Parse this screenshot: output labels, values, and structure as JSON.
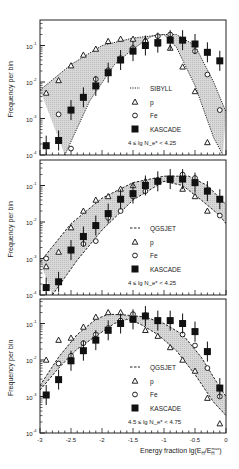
{
  "figure": {
    "ylabel": "Frequency per bin",
    "xlabel": "Energy fraction lg(E",
    "xlabel_sub": "H",
    "xlabel_mid": "/E",
    "xlabel_sub2": "H",
    "xlabel_sup2": "max",
    "xlabel_end": ")",
    "xticks": [
      "-3",
      "-2.5",
      "-2",
      "-1.5",
      "-1",
      "-0.5",
      "0"
    ],
    "yticks": [
      "10",
      "10",
      "10",
      "10"
    ],
    "yexp": [
      "-1",
      "-2",
      "-3",
      "-4"
    ]
  },
  "chart_data": [
    {
      "type": "scatter",
      "title": "",
      "xlabel": "Energy fraction lg(E_H/E_H^max)",
      "ylabel": "Frequency per bin",
      "xlim": [
        -3,
        0
      ],
      "ylim": [
        0.0001,
        0.5
      ],
      "yscale": "log",
      "model": "SIBYLL",
      "model_linestyle": "dotted",
      "condition": "4 ≤ lg N_e* < 4.25",
      "x": [
        -2.9,
        -2.7,
        -2.5,
        -2.3,
        -2.1,
        -1.9,
        -1.7,
        -1.5,
        -1.3,
        -1.1,
        -0.9,
        -0.7,
        -0.5,
        -0.3,
        -0.1
      ],
      "series": [
        {
          "name": "p",
          "marker": "triangle-open",
          "values": [
            0.005,
            0.011,
            0.028,
            0.055,
            0.08,
            0.13,
            0.15,
            0.15,
            0.14,
            0.11,
            0.085,
            0.026,
            0.0055,
            0.00022,
            null
          ]
        },
        {
          "name": "Fe",
          "marker": "circle-open",
          "values": [
            null,
            0.0013,
            0.00015,
            null,
            0.012,
            0.021,
            0.045,
            0.085,
            0.13,
            0.18,
            0.2,
            0.14,
            0.07,
            0.016,
            0.0017
          ]
        },
        {
          "name": "KASCADE",
          "marker": "square-filled",
          "values": [
            0.00018,
            0.00025,
            0.0017,
            0.0038,
            0.0078,
            0.018,
            0.04,
            0.07,
            0.1,
            0.12,
            0.14,
            0.14,
            0.11,
            0.065,
            0.038
          ]
        }
      ],
      "band_upper": [
        [
          -3,
          0.006
        ],
        [
          -2.5,
          0.03
        ],
        [
          -2,
          0.1
        ],
        [
          -1.5,
          0.16
        ],
        [
          -1.0,
          0.2
        ],
        [
          -0.8,
          0.2
        ],
        [
          -0.5,
          0.1
        ],
        [
          -0.2,
          0.01
        ],
        [
          0,
          0.0015
        ]
      ],
      "band_lower": [
        [
          -2.6,
          0.0001
        ],
        [
          -2.2,
          0.003
        ],
        [
          -1.8,
          0.03
        ],
        [
          -1.5,
          0.08
        ],
        [
          -1.2,
          0.18
        ],
        [
          -1.0,
          0.2
        ],
        [
          -0.8,
          0.09
        ],
        [
          -0.5,
          0.008
        ],
        [
          -0.2,
          0.0003
        ],
        [
          -0.05,
          0.0001
        ]
      ]
    },
    {
      "type": "scatter",
      "title": "",
      "xlabel": "Energy fraction lg(E_H/E_H^max)",
      "ylabel": "Frequency per bin",
      "xlim": [
        -3,
        0
      ],
      "ylim": [
        0.0001,
        0.5
      ],
      "yscale": "log",
      "model": "QGSJET",
      "model_linestyle": "dashed",
      "condition": "4 ≤ lg N_e* < 4.25",
      "x": [
        -2.9,
        -2.7,
        -2.5,
        -2.3,
        -2.1,
        -1.9,
        -1.7,
        -1.5,
        -1.3,
        -1.1,
        -0.9,
        -0.7,
        -0.5,
        -0.3,
        -0.1
      ],
      "series": [
        {
          "name": "p",
          "marker": "triangle-open",
          "values": [
            0.0006,
            0.0015,
            0.007,
            0.02,
            0.04,
            0.05,
            0.08,
            0.1,
            0.13,
            0.14,
            0.14,
            0.08,
            0.05,
            0.02,
            null
          ]
        },
        {
          "name": "Fe",
          "marker": "circle-open",
          "values": [
            0.001,
            null,
            null,
            0.0025,
            0.003,
            0.013,
            0.02,
            0.05,
            0.07,
            0.13,
            0.15,
            0.2,
            0.16,
            0.075,
            0.015
          ]
        },
        {
          "name": "KASCADE",
          "marker": "square-filled",
          "values": [
            0.00016,
            0.00023,
            0.0017,
            0.004,
            0.008,
            0.017,
            0.042,
            0.06,
            0.1,
            0.13,
            0.15,
            0.15,
            0.12,
            0.07,
            0.042
          ]
        }
      ],
      "band_upper": [
        [
          -3,
          0.0008
        ],
        [
          -2.5,
          0.009
        ],
        [
          -2,
          0.045
        ],
        [
          -1.5,
          0.12
        ],
        [
          -1.0,
          0.18
        ],
        [
          -0.6,
          0.18
        ],
        [
          -0.3,
          0.1
        ],
        [
          0,
          0.03
        ]
      ],
      "band_lower": [
        [
          -2.8,
          0.0001
        ],
        [
          -2.4,
          0.0009
        ],
        [
          -2,
          0.006
        ],
        [
          -1.5,
          0.04
        ],
        [
          -1.0,
          0.13
        ],
        [
          -0.7,
          0.1
        ],
        [
          -0.4,
          0.04
        ],
        [
          -0.1,
          0.015
        ],
        [
          0,
          0.009
        ]
      ]
    },
    {
      "type": "scatter",
      "title": "",
      "xlabel": "Energy fraction lg(E_H/E_H^max)",
      "ylabel": "Frequency per bin",
      "xlim": [
        -3,
        0
      ],
      "ylim": [
        0.0001,
        0.5
      ],
      "yscale": "log",
      "model": "QGSJET",
      "model_linestyle": "dashed",
      "condition": "4.5 ≤ lg N_e* < 4.75",
      "x": [
        -2.9,
        -2.7,
        -2.5,
        -2.3,
        -2.1,
        -1.9,
        -1.7,
        -1.5,
        -1.3,
        -1.1,
        -0.9,
        -0.7,
        -0.5,
        -0.3,
        -0.1
      ],
      "series": [
        {
          "name": "p",
          "marker": "triangle-open",
          "values": [
            0.01,
            0.035,
            0.04,
            0.08,
            0.15,
            0.2,
            0.2,
            0.15,
            0.065,
            0.045,
            0.022,
            0.01,
            0.005,
            0.0009,
            0.00018
          ]
        },
        {
          "name": "Fe",
          "marker": "circle-open",
          "values": [
            null,
            0.008,
            0.013,
            0.029,
            0.05,
            0.075,
            0.12,
            0.18,
            0.17,
            0.12,
            0.12,
            0.05,
            0.025,
            0.006,
            0.001
          ]
        },
        {
          "name": "KASCADE",
          "marker": "square-filled",
          "values": [
            0.0011,
            0.0029,
            0.0095,
            0.018,
            0.035,
            0.065,
            0.1,
            0.13,
            0.16,
            0.12,
            0.12,
            0.1,
            0.06,
            0.017,
            0.0017
          ]
        }
      ],
      "band_upper": [
        [
          -3,
          0.002
        ],
        [
          -2.7,
          0.012
        ],
        [
          -2.4,
          0.05
        ],
        [
          -2.1,
          0.13
        ],
        [
          -1.9,
          0.18
        ],
        [
          -1.6,
          0.17
        ],
        [
          -1.3,
          0.15
        ],
        [
          -1.0,
          0.1
        ],
        [
          -0.7,
          0.05
        ],
        [
          -0.4,
          0.012
        ],
        [
          -0.1,
          0.0018
        ],
        [
          0,
          0.001
        ]
      ],
      "band_lower": [
        [
          -3,
          0.0015
        ],
        [
          -2.7,
          0.006
        ],
        [
          -2.4,
          0.02
        ],
        [
          -2.1,
          0.045
        ],
        [
          -1.8,
          0.1
        ],
        [
          -1.6,
          0.13
        ],
        [
          -1.4,
          0.1
        ],
        [
          -1.1,
          0.05
        ],
        [
          -0.8,
          0.018
        ],
        [
          -0.5,
          0.004
        ],
        [
          -0.2,
          0.0007
        ],
        [
          0,
          0.0003
        ]
      ]
    }
  ]
}
